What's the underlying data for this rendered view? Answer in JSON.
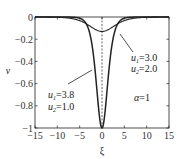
{
  "chart_data": {
    "type": "line",
    "title": "",
    "xlabel": "ξ",
    "ylabel": "v",
    "xlim": [
      -15,
      15
    ],
    "ylim": [
      -1,
      0
    ],
    "xticks": [
      -15,
      -10,
      -5,
      0,
      5,
      10,
      15
    ],
    "yticks": [
      0,
      -0.2,
      -0.4,
      -0.6,
      -0.8,
      -1
    ],
    "xtick_labels": [
      "−15",
      "−10",
      "−5",
      "0",
      "5",
      "10",
      "15"
    ],
    "ytick_labels": [
      "0",
      "−0.2",
      "−0.4",
      "−0.6",
      "−0.8",
      "−1"
    ],
    "grid": false,
    "legend": "none",
    "series": [
      {
        "name": "u1=3.8, u2=1.0",
        "style": "solid",
        "x": [
          -15,
          -10,
          -8,
          -6,
          -5,
          -4,
          -3,
          -2.5,
          -2,
          -1.5,
          -1,
          -0.5,
          0,
          0.5,
          1,
          1.5,
          2,
          2.5,
          3,
          4,
          5,
          6,
          8,
          10,
          15
        ],
        "values": [
          0,
          0,
          -0.0002,
          -0.004,
          -0.011,
          -0.035,
          -0.11,
          -0.19,
          -0.33,
          -0.5,
          -0.71,
          -0.92,
          -1.0,
          -0.92,
          -0.71,
          -0.5,
          -0.33,
          -0.19,
          -0.11,
          -0.035,
          -0.011,
          -0.004,
          -0.0002,
          0,
          0
        ]
      },
      {
        "name": "u1=3.0, u2=2.0",
        "style": "solid",
        "x": [
          -15,
          -10,
          -8,
          -6,
          -5,
          -4,
          -3,
          -2,
          -1,
          0,
          1,
          2,
          3,
          4,
          5,
          6,
          8,
          10,
          15
        ],
        "values": [
          0,
          -0.001,
          -0.004,
          -0.02,
          -0.035,
          -0.055,
          -0.08,
          -0.105,
          -0.125,
          -0.13,
          -0.125,
          -0.105,
          -0.08,
          -0.055,
          -0.035,
          -0.02,
          -0.004,
          -0.001,
          0
        ]
      },
      {
        "name": "centerline",
        "style": "dashed",
        "x": [
          0,
          0
        ],
        "values": [
          0,
          -1
        ]
      }
    ],
    "annotations": [
      {
        "text": "u1=3.0",
        "line2": "u2=2.0",
        "pointer_to": "shallow curve near ξ≈3.5"
      },
      {
        "text": "u1=3.8",
        "line2": "u2=1.0",
        "pointer_to": "deep curve near ξ≈-2"
      },
      {
        "text": "α=1"
      }
    ]
  },
  "labels": {
    "xlabel": "ξ",
    "ylabel": "v",
    "ann1_u1_sym": "u",
    "ann1_u1_sub": "1",
    "ann1_u1_val": "=3.0",
    "ann1_u2_sym": "u",
    "ann1_u2_sub": "2",
    "ann1_u2_val": "=2.0",
    "ann2_u1_sym": "u",
    "ann2_u1_sub": "1",
    "ann2_u1_val": "=3.8",
    "ann2_u2_sym": "u",
    "ann2_u2_sub": "2",
    "ann2_u2_val": "=1.0",
    "alpha_sym": "α",
    "alpha_val": "=1"
  }
}
